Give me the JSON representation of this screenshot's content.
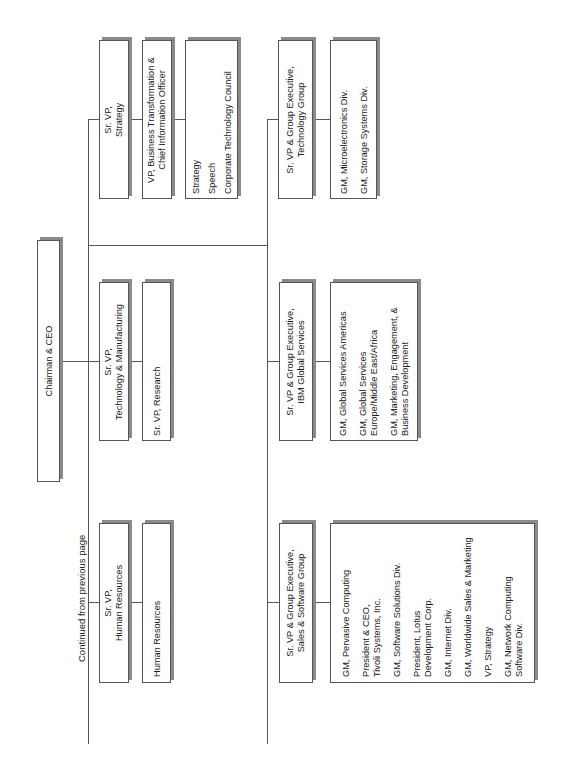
{
  "orientation": "rotated-90-ccw",
  "caption": "Continued from previous page",
  "root": {
    "title": "Chairman & CEO"
  },
  "left_branch": {
    "units": [
      {
        "title": "Sr. VP,\nStrategy",
        "reports": [
          {
            "items": [
              "VP, Business Transformation &\nChief Information Officer"
            ]
          },
          {
            "items": [
              "Strategy",
              "Speech",
              "Corporate Technology Council"
            ]
          }
        ]
      },
      {
        "title": "Sr. VP,\nTechnology & Manufacturing",
        "reports": [
          {
            "items": [
              "Sr. VP, Research"
            ]
          }
        ]
      },
      {
        "title": "Sr. VP,\nHuman Resources",
        "reports": [
          {
            "items": [
              "Human Resources"
            ]
          }
        ]
      }
    ]
  },
  "right_branch": {
    "units": [
      {
        "title": "Sr. VP & Group Executive,\nTechnology Group",
        "reports": [
          {
            "items": [
              "GM, Microelectronics Div.",
              "GM, Storage Systems Div."
            ]
          }
        ]
      },
      {
        "title": "Sr. VP & Group Executive,\nIBM Global Services",
        "reports": [
          {
            "items": [
              "GM, Global Services Americas",
              "GM, Global Services\nEurope/Middle East/Africa",
              "GM, Marketing, Engagement, &\nBusiness Development"
            ]
          }
        ]
      },
      {
        "title": "Sr. VP & Group Executive,\nSales & Software Group",
        "reports": [
          {
            "items": [
              "GM, Pervasive Computing",
              "President & CEO,\nTivoli Systems, Inc.",
              "GM, Software Solutions Div.",
              "President, Lotus\nDevelopment Corp.",
              "GM, Internet Div.",
              "GM, Worldwide Sales & Marketing",
              "VP, Strategy",
              "GM, Network Computing\nSoftware Div."
            ]
          }
        ]
      }
    ]
  },
  "colors": {
    "line": "#555555",
    "shadow": "#8a8a8a",
    "background": "#ffffff"
  }
}
